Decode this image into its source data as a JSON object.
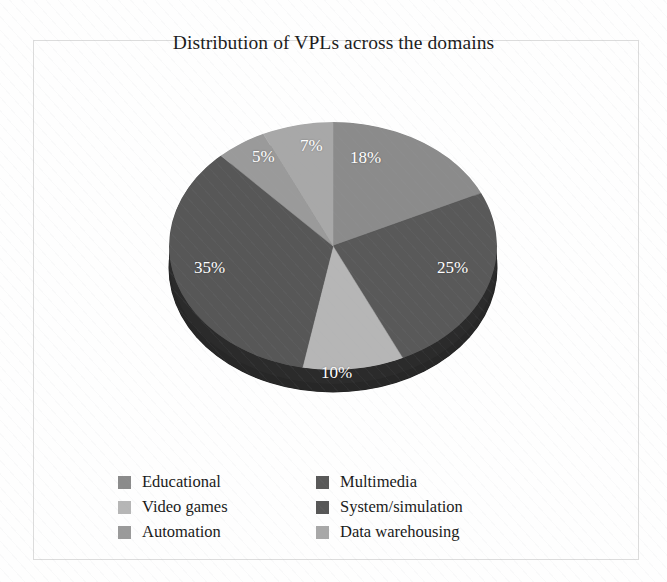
{
  "chart_data": {
    "type": "pie",
    "title": "Distribution of VPLs across the domains",
    "xlabel": "",
    "ylabel": "",
    "legend_position": "bottom",
    "grid": false,
    "three_d": true,
    "start_angle_deg": 0,
    "direction": "clockwise",
    "categories": [
      "Educational",
      "Multimedia",
      "Video games",
      "System/simulation",
      "Automation",
      "Data warehousing"
    ],
    "values": [
      18,
      25,
      10,
      35,
      5,
      7
    ],
    "value_labels": [
      "18%",
      "25%",
      "10%",
      "35%",
      "5%",
      "7%"
    ],
    "colors": [
      "#8b8b8b",
      "#595959",
      "#b6b6b6",
      "#575757",
      "#9a9a9a",
      "#a8a8a8"
    ],
    "depth_color": "#2b2b2b",
    "label_color": "#ffffff"
  },
  "chart": {
    "title": "Distribution of VPLs across the domains",
    "slices": [
      {
        "label": "18%",
        "name": "Educational",
        "value": 18,
        "color": "#8b8b8b",
        "lx": 350,
        "ly": 148
      },
      {
        "label": "25%",
        "name": "Multimedia",
        "value": 25,
        "color": "#595959",
        "lx": 437,
        "ly": 258
      },
      {
        "label": "10%",
        "name": "Video games",
        "value": 10,
        "color": "#b6b6b6",
        "lx": 321,
        "ly": 363
      },
      {
        "label": "35%",
        "name": "System/simulation",
        "value": 35,
        "color": "#575757",
        "lx": 194,
        "ly": 258
      },
      {
        "label": "5%",
        "name": "Automation",
        "value": 5,
        "color": "#9a9a9a",
        "lx": 252,
        "ly": 147
      },
      {
        "label": "7%",
        "name": "Data warehousing",
        "value": 7,
        "color": "#a8a8a8",
        "lx": 300,
        "ly": 136
      }
    ]
  },
  "legend": {
    "left_column": [
      {
        "label": "Educational",
        "color": "#8b8b8b"
      },
      {
        "label": "Video games",
        "color": "#b6b6b6"
      },
      {
        "label": "Automation",
        "color": "#9a9a9a"
      }
    ],
    "right_column": [
      {
        "label": "Multimedia",
        "color": "#595959"
      },
      {
        "label": "System/simulation",
        "color": "#575757"
      },
      {
        "label": "Data warehousing",
        "color": "#a8a8a8"
      }
    ]
  }
}
